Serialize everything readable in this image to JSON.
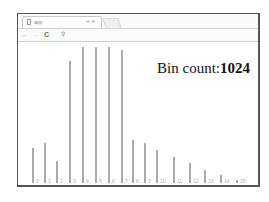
{
  "browser": {
    "tab": {
      "title": "app",
      "close_icon": "×",
      "pin_icon": "+"
    },
    "toolbar": {
      "back_icon": "←",
      "forward_icon": "→",
      "reload_icon": "C",
      "search_icon": "⚲"
    },
    "omnibox": {
      "value": ""
    }
  },
  "page": {
    "bin_count_label": "Bin count:",
    "bin_count_value": "1024"
  },
  "chart_data": {
    "type": "bar",
    "title": "Bin count:1024",
    "categories": [
      "0",
      "1",
      "2",
      "3",
      "4",
      "5",
      "6",
      "7",
      "8",
      "9",
      "10",
      "11",
      "12",
      "13",
      "14",
      "15"
    ],
    "values": [
      35,
      40,
      22,
      122,
      136,
      136,
      136,
      133,
      43,
      40,
      33,
      26,
      20,
      13,
      8,
      3
    ],
    "xlabel": "",
    "ylabel": "",
    "grid": false,
    "color": "#aaaaaa"
  }
}
